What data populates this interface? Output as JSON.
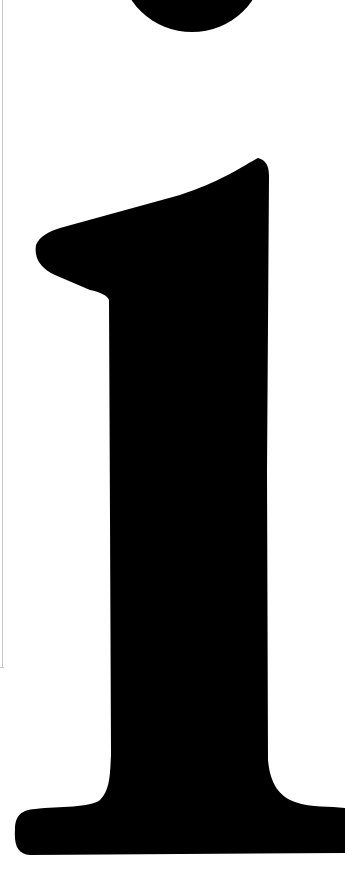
{
  "image": {
    "description": "Large black serif lowercase letter i on white background",
    "glyph": "i",
    "glyph_color": "#000000",
    "background_color": "#ffffff",
    "frame_line_color": "#c8c8c8"
  }
}
